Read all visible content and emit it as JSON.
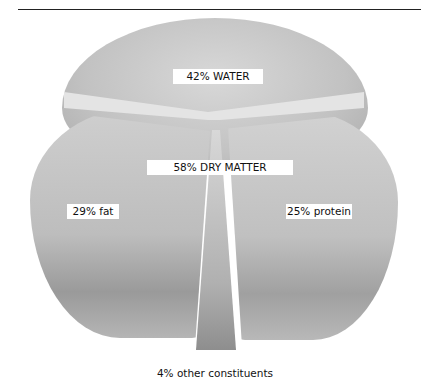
{
  "page": {
    "header_text": "16      CHEESE"
  },
  "figure": {
    "labels": {
      "water": "42% WATER",
      "dry_matter": "58% DRY MATTER",
      "fat": "29% fat",
      "protein": "25% protein",
      "other": "4% other constituents"
    }
  },
  "chart_data": {
    "type": "pie",
    "categories": [
      "Water",
      "Fat",
      "Protein",
      "Other constituents"
    ],
    "values": [
      42,
      29,
      25,
      4
    ],
    "groups": [
      {
        "name": "Dry matter",
        "value": 58,
        "members": [
          "Fat",
          "Protein",
          "Other constituents"
        ]
      }
    ],
    "units": "%"
  }
}
